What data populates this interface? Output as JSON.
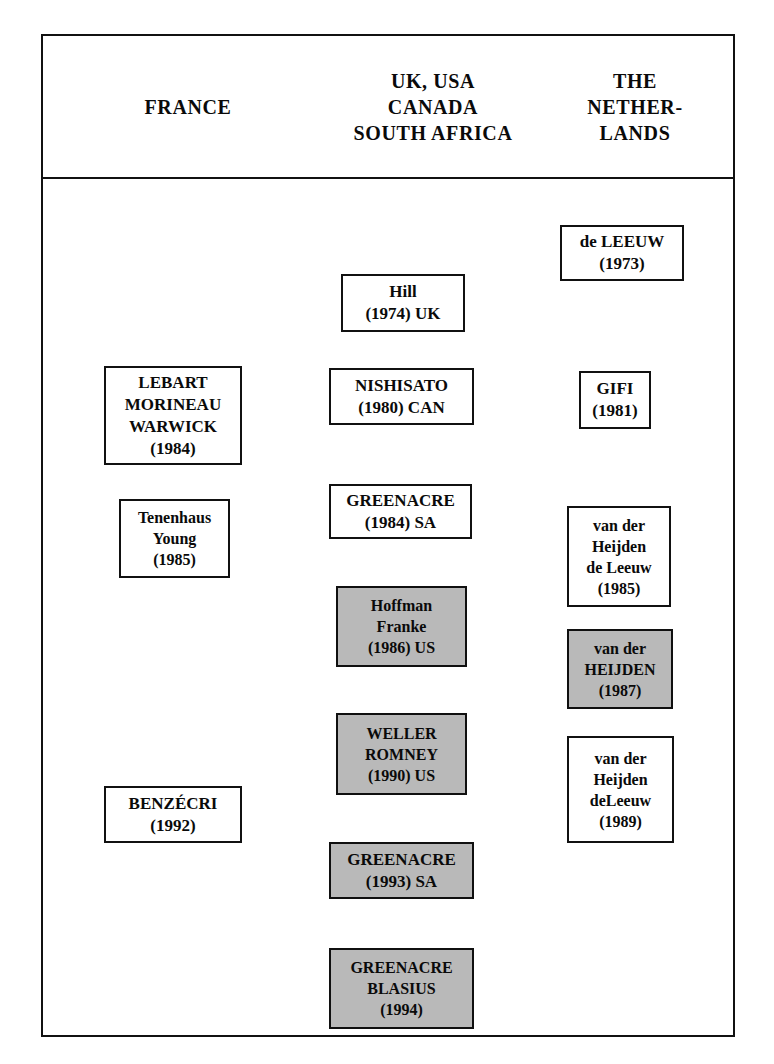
{
  "figure": {
    "headers": [
      {
        "id": "france",
        "label": "FRANCE"
      },
      {
        "id": "uk-usa-canada-south-africa",
        "label": "UK, USA\nCANADA\nSOUTH AFRICA"
      },
      {
        "id": "the-netherlands",
        "label": "THE\nNETHER-\nLANDS"
      }
    ],
    "colors": {
      "frame": "#111111",
      "box_border": "#111111",
      "box_fill": "#ffffff",
      "shaded_box_fill": "#b9b9b9",
      "text": "#0a0a0a",
      "background": "#ffffff"
    },
    "boxes": [
      {
        "id": "lebart-morineau-warwick-1984",
        "column": "france",
        "shaded": false,
        "lines": [
          "LEBART",
          "MORINEAU",
          "WARWICK",
          "(1984)"
        ]
      },
      {
        "id": "tenenhaus-young-1985",
        "column": "france",
        "shaded": false,
        "lines": [
          "Tenenhaus",
          "Young",
          "(1985)"
        ]
      },
      {
        "id": "benzecri-1992",
        "column": "france",
        "shaded": false,
        "lines": [
          "BENZÉCRI",
          "(1992)"
        ]
      },
      {
        "id": "hill-1974-uk",
        "column": "uk-usa-canada-south-africa",
        "shaded": false,
        "lines": [
          "Hill",
          "(1974) UK"
        ]
      },
      {
        "id": "nishisato-1980-can",
        "column": "uk-usa-canada-south-africa",
        "shaded": false,
        "lines": [
          "NISHISATO",
          "(1980) CAN"
        ]
      },
      {
        "id": "greenacre-1984-sa",
        "column": "uk-usa-canada-south-africa",
        "shaded": false,
        "lines": [
          "GREENACRE",
          "(1984) SA"
        ]
      },
      {
        "id": "hoffman-franke-1986-us",
        "column": "uk-usa-canada-south-africa",
        "shaded": true,
        "lines": [
          "Hoffman",
          "Franke",
          "(1986) US"
        ]
      },
      {
        "id": "weller-romney-1990-us",
        "column": "uk-usa-canada-south-africa",
        "shaded": true,
        "lines": [
          "WELLER",
          "ROMNEY",
          "(1990) US"
        ]
      },
      {
        "id": "greenacre-1993-sa",
        "column": "uk-usa-canada-south-africa",
        "shaded": true,
        "lines": [
          "GREENACRE",
          "(1993) SA"
        ]
      },
      {
        "id": "greenacre-blasius-1994",
        "column": "uk-usa-canada-south-africa",
        "shaded": true,
        "lines": [
          "GREENACRE",
          "BLASIUS",
          "(1994)"
        ]
      },
      {
        "id": "de-leeuw-1973",
        "column": "the-netherlands",
        "shaded": false,
        "lines": [
          "de LEEUW",
          "(1973)"
        ]
      },
      {
        "id": "gifi-1981",
        "column": "the-netherlands",
        "shaded": false,
        "lines": [
          "GIFI",
          "(1981)"
        ]
      },
      {
        "id": "van-der-heijden-de-leeuw-1985",
        "column": "the-netherlands",
        "shaded": false,
        "lines": [
          "van der",
          "Heijden",
          "de Leeuw",
          "(1985)"
        ]
      },
      {
        "id": "van-der-heijden-1987",
        "column": "the-netherlands",
        "shaded": true,
        "lines": [
          "van der",
          "HEIJDEN",
          "(1987)"
        ]
      },
      {
        "id": "van-der-heijden-deleeuw-1989",
        "column": "the-netherlands",
        "shaded": false,
        "lines": [
          "van der",
          "Heijden",
          "deLeeuw",
          "(1989)"
        ]
      }
    ]
  }
}
